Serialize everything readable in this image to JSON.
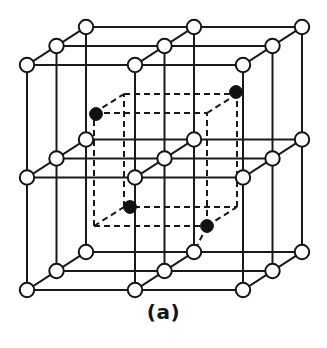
{
  "figure": {
    "caption": "(a)",
    "kind": "crystal-lattice-unit-cell",
    "colors": {
      "background": "#ffffff",
      "line": "#1a1a1a",
      "open_atom_fill": "#ffffff",
      "open_atom_stroke": "#141414",
      "filled_atom_fill": "#111111",
      "dashed_line": "#1a1a1a"
    },
    "geometry": {
      "outer_cube": {
        "front_bottom_left": [
          27,
          290
        ],
        "front_bottom_right": [
          243,
          290
        ],
        "front_top_left": [
          27,
          65
        ],
        "front_top_right": [
          243,
          65
        ],
        "depth_dx": 59,
        "depth_dy": -38,
        "divisions": 2
      },
      "inner_cube": {
        "front_bottom_left": [
          94,
          226
        ],
        "size_x": 113,
        "size_y": 113,
        "depth_dx": 30,
        "depth_dy": -19
      },
      "open_atom_radius": 7.2,
      "filled_atom_radius": 6.4,
      "line_width": 2.0,
      "dash_pattern": "6,4"
    },
    "counts": {
      "open_atoms": 27,
      "filled_atoms": 4,
      "open_atoms_label": "27",
      "filled_atoms_label": "4"
    },
    "filled_atom_positions": [
      [
        96,
        114
      ],
      [
        236,
        92
      ],
      [
        130,
        207
      ],
      [
        207,
        226
      ]
    ]
  }
}
